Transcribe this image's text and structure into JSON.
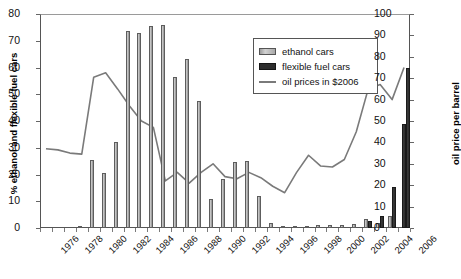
{
  "chart_data": {
    "type": "bar",
    "title": "",
    "xlabel": "",
    "ylabel": "% ethanol and flexible fuel cars",
    "ylabel_secondary": "oil price per barrel",
    "ylim": [
      0,
      80
    ],
    "ylim_secondary": [
      0,
      100
    ],
    "ytick_step": 10,
    "ytick_step_secondary": 10,
    "grid": false,
    "legend_position": "upper-right-inside",
    "xtick_label_interval": 2,
    "xtick_label_rotation": -45,
    "categories": [
      "1976",
      "1977",
      "1978",
      "1979",
      "1980",
      "1981",
      "1982",
      "1983",
      "1984",
      "1985",
      "1986",
      "1987",
      "1988",
      "1989",
      "1990",
      "1991",
      "1992",
      "1993",
      "1994",
      "1995",
      "1996",
      "1997",
      "1998",
      "1999",
      "2000",
      "2001",
      "2002",
      "2003",
      "2004",
      "2005",
      "2006"
    ],
    "xtick_labels": [
      "1976",
      "1978",
      "1980",
      "1982",
      "1984",
      "1986",
      "1988",
      "1990",
      "1992",
      "1994",
      "1996",
      "1998",
      "2000",
      "2002",
      "2004",
      "2006"
    ],
    "ytick_labels": [
      "0",
      "10",
      "20",
      "30",
      "40",
      "50",
      "60",
      "70",
      "80"
    ],
    "ytick_labels_secondary": [
      "0",
      "10",
      "20",
      "30",
      "40",
      "50",
      "60",
      "70",
      "80",
      "90",
      "100"
    ],
    "series": [
      {
        "name": "ethanol cars",
        "type": "bar",
        "axis": "left",
        "color": "#b0b0b0",
        "values": [
          0,
          0,
          0,
          0.5,
          25.5,
          20.7,
          32.0,
          73.5,
          73.0,
          75.5,
          76.0,
          56.5,
          63.0,
          47.5,
          11.0,
          18.5,
          24.5,
          25.0,
          12.0,
          2.0,
          0.6,
          0.5,
          0.5,
          1.3,
          1.0,
          1.0,
          1.5,
          3.5,
          2.0,
          4.5,
          0.0
        ]
      },
      {
        "name": "flexible fuel cars",
        "type": "bar",
        "axis": "left",
        "color": "#2d2d2d",
        "values": [
          0,
          0,
          0,
          0,
          0,
          0,
          0,
          0,
          0,
          0,
          0,
          0,
          0,
          0,
          0,
          0,
          0,
          0,
          0,
          0,
          0,
          0,
          0,
          0,
          0,
          0,
          0,
          2.5,
          4.5,
          15.5,
          39.0
        ]
      },
      {
        "name": "oil prices in $2006",
        "type": "line",
        "axis": "right",
        "color": "#7a7a7a",
        "values": [
          37.0,
          36.5,
          35.0,
          34.5,
          70.5,
          72.5,
          65.0,
          57.0,
          50.0,
          47.0,
          22.0,
          26.0,
          21.0,
          26.0,
          30.0,
          24.0,
          23.0,
          26.0,
          23.5,
          19.5,
          16.5,
          26.0,
          34.0,
          29.0,
          28.5,
          32.0,
          45.0,
          65.0,
          67.0,
          60.0,
          75.0
        ]
      }
    ],
    "extra_bars": {
      "note": "2006 flexible fuel additional bar",
      "values_2006": [
        39.0,
        60.0
      ]
    },
    "legend": [
      {
        "label": "ethanol cars",
        "marker": "bar-light"
      },
      {
        "label": "flexible fuel cars",
        "marker": "bar-dark"
      },
      {
        "label": "oil prices in $2006",
        "marker": "line-gray"
      }
    ]
  }
}
